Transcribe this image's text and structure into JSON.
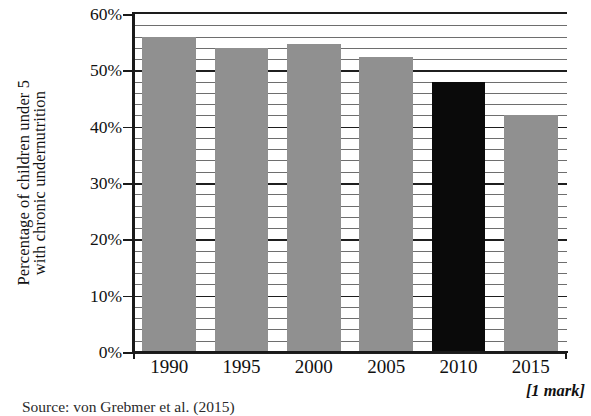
{
  "chart_data": {
    "type": "bar",
    "title": "",
    "subtitle": "",
    "xlabel": "",
    "ylabel": "Percentage of children under 5 with chronic undernutrition",
    "ylabel_lines": [
      "Percentage of children under 5",
      "with chronic undernutrition"
    ],
    "categories": [
      "1990",
      "1995",
      "2000",
      "2005",
      "2010",
      "2015"
    ],
    "values": [
      56,
      54,
      54.7,
      52.3,
      48,
      42
    ],
    "value_labels": [
      "56%",
      "54%",
      "54.7%",
      "52.3%",
      "48%",
      "42%"
    ],
    "series": [
      {
        "name": "Percentage of children under 5 with chronic undernutrition",
        "values": [
          56,
          54,
          54.7,
          52.3,
          48,
          42
        ]
      }
    ],
    "bar_colors": [
      "#909090",
      "#909090",
      "#909090",
      "#909090",
      "#0a0a0a",
      "#909090"
    ],
    "highlight_category": "2010",
    "ylim": [
      0,
      60
    ],
    "xlim_categories": 6,
    "ytick_values": [
      0,
      10,
      20,
      30,
      40,
      50,
      60
    ],
    "ytick_labels": [
      "0%",
      "10%",
      "20%",
      "30%",
      "40%",
      "50%",
      "60%"
    ],
    "minor_tick_interval": 2,
    "major_tick_interval": 10,
    "grid": true,
    "grid_axis": "y",
    "grid_minor": true,
    "legend": false,
    "legend_position": "none"
  },
  "notes": {
    "source": "Source: von Grebmer et al. (2015)",
    "mark": "[1 mark]"
  },
  "colors": {
    "bar_gray": "#909090",
    "bar_black": "#0a0a0a",
    "axis": "#1a1a1a",
    "gridline_minor": "#6e6e6e",
    "gridline_major": "#1f1f1f",
    "background": "#ffffff",
    "text": "#111111"
  }
}
